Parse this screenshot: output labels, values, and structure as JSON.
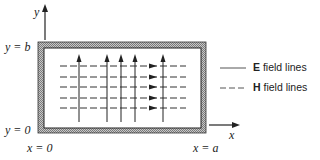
{
  "diagram": {
    "type": "waveguide-cross-section",
    "axes": {
      "x_label": "x",
      "y_label": "y"
    },
    "boundary_labels": {
      "y_top": "y = b",
      "y_bottom": "y = 0",
      "x_left": "x = 0",
      "x_right": "x = a"
    },
    "legend": [
      {
        "style": "solid",
        "symbol": "E",
        "text": " field lines"
      },
      {
        "style": "dashed",
        "symbol": "H",
        "text": " field lines"
      }
    ],
    "e_field_lines_count": 5,
    "h_field_lines_count": 5,
    "colors": {
      "line": "#222222",
      "wall_fill": "#9a9a9a",
      "background": "#ffffff"
    }
  }
}
